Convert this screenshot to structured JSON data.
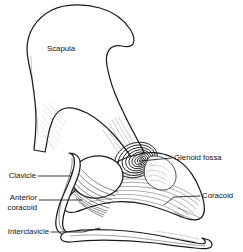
{
  "figure": {
    "background_color": "#ffffff",
    "line_color": "#1a1a1a",
    "width": 243,
    "height": 252,
    "style": "black-and-white pen-and-ink anatomical illustration"
  },
  "labels": {
    "scapula": "Scapula",
    "glenoid_fossa": "Glenoid fossa",
    "coracoid": "Coracoid",
    "clavicle": "Clavicle",
    "anterior_line1": "Anterior",
    "anterior_line2": "coracoid",
    "interclavicle": "Interclavicle"
  },
  "structures": [
    {
      "name": "scapula",
      "label": "Scapula",
      "label_placement": "internal",
      "leader": false
    },
    {
      "name": "glenoid-fossa",
      "label": "Glenoid fossa",
      "label_placement": "right",
      "leader": true
    },
    {
      "name": "coracoid",
      "label": "Coracoid",
      "label_placement": "right",
      "leader": true
    },
    {
      "name": "clavicle",
      "label": "Clavicle",
      "label_placement": "left",
      "leader": true
    },
    {
      "name": "anterior-coracoid",
      "label": "Anterior coracoid",
      "label_placement": "left",
      "leader": true
    },
    {
      "name": "interclavicle",
      "label": "Interclavicle",
      "label_placement": "left",
      "leader": true
    }
  ]
}
